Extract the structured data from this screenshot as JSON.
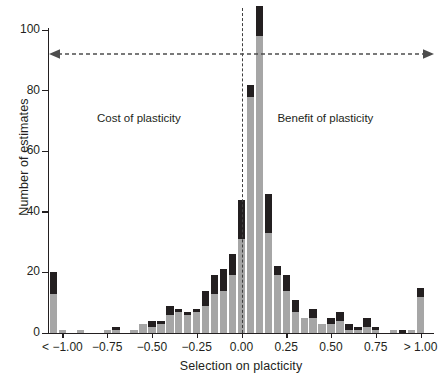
{
  "chart_data": {
    "type": "bar",
    "title": "",
    "subtitle": "",
    "xlabel": "Selection on placticity",
    "ylabel": "Number of estimates",
    "ylim": [
      0,
      105
    ],
    "xlim": [
      -1.075,
      1.075
    ],
    "grid": false,
    "legend_position": "none",
    "bin_width": 0.05,
    "bar_color_lower": "#a6a6a6",
    "bar_color_upper": "#231f20",
    "y_ticks": [
      0,
      20,
      40,
      60,
      80,
      100
    ],
    "y_tick_labels": [
      "0",
      "20",
      "40",
      "60",
      "80",
      "100"
    ],
    "x_ticks": [
      -1.0,
      -0.75,
      -0.5,
      -0.25,
      0.0,
      0.25,
      0.5,
      0.75,
      1.0
    ],
    "x_tick_labels": [
      "< −1.00",
      "−0.75",
      "−0.50",
      "−0.25",
      "0.00",
      "0.25",
      "0.50",
      "0.75",
      "> 1.00"
    ],
    "series": [
      {
        "name": "lower-gray",
        "color": "#a6a6a6"
      },
      {
        "name": "upper-black",
        "color": "#231f20"
      }
    ],
    "x": [
      -1.05,
      -1.0,
      -0.95,
      -0.9,
      -0.85,
      -0.8,
      -0.75,
      -0.7,
      -0.65,
      -0.6,
      -0.55,
      -0.5,
      -0.45,
      -0.4,
      -0.35,
      -0.3,
      -0.25,
      -0.2,
      -0.15,
      -0.1,
      -0.05,
      0.0,
      0.05,
      0.1,
      0.15,
      0.2,
      0.25,
      0.3,
      0.35,
      0.4,
      0.45,
      0.5,
      0.55,
      0.6,
      0.65,
      0.7,
      0.75,
      0.8,
      0.85,
      0.9,
      0.95,
      1.0
    ],
    "bins": [
      {
        "x": -1.05,
        "gray": 13,
        "black": 7,
        "total": 20
      },
      {
        "x": -1.0,
        "gray": 1,
        "black": 0,
        "total": 1
      },
      {
        "x": -0.95,
        "gray": 0,
        "black": 0,
        "total": 0
      },
      {
        "x": -0.9,
        "gray": 1,
        "black": 0,
        "total": 1
      },
      {
        "x": -0.85,
        "gray": 0,
        "black": 0,
        "total": 0
      },
      {
        "x": -0.8,
        "gray": 0,
        "black": 0,
        "total": 0
      },
      {
        "x": -0.75,
        "gray": 1,
        "black": 0,
        "total": 1
      },
      {
        "x": -0.7,
        "gray": 1,
        "black": 1,
        "total": 2
      },
      {
        "x": -0.65,
        "gray": 0,
        "black": 0,
        "total": 0
      },
      {
        "x": -0.6,
        "gray": 1,
        "black": 0,
        "total": 1
      },
      {
        "x": -0.55,
        "gray": 3,
        "black": 0,
        "total": 3
      },
      {
        "x": -0.5,
        "gray": 2,
        "black": 2,
        "total": 4
      },
      {
        "x": -0.45,
        "gray": 3,
        "black": 1,
        "total": 4
      },
      {
        "x": -0.4,
        "gray": 6,
        "black": 3,
        "total": 9
      },
      {
        "x": -0.35,
        "gray": 7,
        "black": 1,
        "total": 8
      },
      {
        "x": -0.3,
        "gray": 6,
        "black": 1,
        "total": 7
      },
      {
        "x": -0.25,
        "gray": 7,
        "black": 1,
        "total": 8
      },
      {
        "x": -0.2,
        "gray": 9,
        "black": 5,
        "total": 14
      },
      {
        "x": -0.15,
        "gray": 13,
        "black": 6,
        "total": 19
      },
      {
        "x": -0.1,
        "gray": 14,
        "black": 7,
        "total": 21
      },
      {
        "x": -0.05,
        "gray": 19,
        "black": 7,
        "total": 26
      },
      {
        "x": 0.0,
        "gray": 31,
        "black": 13,
        "total": 44
      },
      {
        "x": 0.05,
        "gray": 78,
        "black": 4,
        "total": 82
      },
      {
        "x": 0.1,
        "gray": 98,
        "black": 10,
        "total": 108
      },
      {
        "x": 0.15,
        "gray": 33,
        "black": 13,
        "total": 46
      },
      {
        "x": 0.2,
        "gray": 19,
        "black": 3,
        "total": 22
      },
      {
        "x": 0.25,
        "gray": 14,
        "black": 5,
        "total": 19
      },
      {
        "x": 0.3,
        "gray": 7,
        "black": 4,
        "total": 11
      },
      {
        "x": 0.35,
        "gray": 5,
        "black": 0,
        "total": 5
      },
      {
        "x": 0.4,
        "gray": 5,
        "black": 3,
        "total": 8
      },
      {
        "x": 0.45,
        "gray": 3,
        "black": 0,
        "total": 3
      },
      {
        "x": 0.5,
        "gray": 3,
        "black": 2,
        "total": 5
      },
      {
        "x": 0.55,
        "gray": 4,
        "black": 3,
        "total": 7
      },
      {
        "x": 0.6,
        "gray": 1,
        "black": 2,
        "total": 3
      },
      {
        "x": 0.65,
        "gray": 1,
        "black": 1,
        "total": 2
      },
      {
        "x": 0.7,
        "gray": 2,
        "black": 3,
        "total": 5
      },
      {
        "x": 0.75,
        "gray": 1,
        "black": 1,
        "total": 2
      },
      {
        "x": 0.8,
        "gray": 0,
        "black": 0,
        "total": 0
      },
      {
        "x": 0.85,
        "gray": 1,
        "black": 0,
        "total": 1
      },
      {
        "x": 0.9,
        "gray": 0,
        "black": 1,
        "total": 1
      },
      {
        "x": 0.95,
        "gray": 1,
        "black": 0,
        "total": 1
      },
      {
        "x": 1.0,
        "gray": 12,
        "black": 3,
        "total": 15
      }
    ],
    "annotations": [
      {
        "name": "cost-of-plasticity",
        "text": "Cost of plasticity",
        "x": -0.55,
        "y": 73
      },
      {
        "name": "benefit-of-plasticity",
        "text": "Benefit of plasticity",
        "x": 0.48,
        "y": 73
      },
      {
        "name": "span-arrow",
        "type": "double-headed-dashed-arrow",
        "y": 92,
        "color": "#4d4d4d"
      },
      {
        "name": "zero-reference-line",
        "type": "vertical-dashed-line",
        "x": 0.0,
        "color": "#3f3f3f"
      }
    ]
  }
}
